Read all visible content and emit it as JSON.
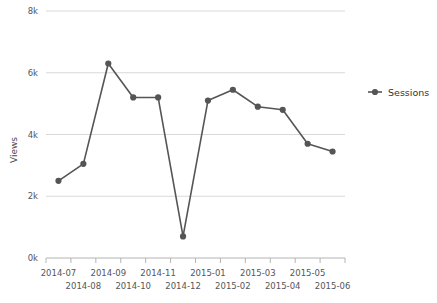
{
  "chart_data": {
    "type": "line",
    "title": "",
    "xlabel": "",
    "ylabel": "Views",
    "categories": [
      "2014-07",
      "2014-08",
      "2014-09",
      "2014-10",
      "2014-11",
      "2014-12",
      "2015-01",
      "2015-02",
      "2015-03",
      "2015-04",
      "2015-05",
      "2015-06"
    ],
    "series": [
      {
        "name": "Sessions",
        "color": "#555555",
        "marker": "circle",
        "values": [
          2500,
          3050,
          6300,
          5200,
          5200,
          700,
          5100,
          5450,
          4900,
          4800,
          3700,
          3450
        ]
      }
    ],
    "ylim": [
      0,
      8000
    ],
    "yticks": [
      0,
      2000,
      4000,
      6000,
      8000
    ],
    "ytick_labels": [
      "0k",
      "2k",
      "4k",
      "6k",
      "8k"
    ],
    "grid": true,
    "grid_color": "#d9d9d9",
    "legend_position": "right",
    "axis_color": "#b4b4b4"
  },
  "legend": {
    "entries": [
      {
        "label": "Sessions",
        "color": "#555555"
      }
    ]
  }
}
